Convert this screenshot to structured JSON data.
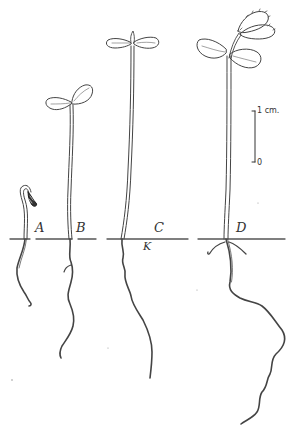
{
  "figure": {
    "ink_color": "#444444",
    "background": "#ffffff",
    "seedlings": [
      {
        "id": "A",
        "label": "A",
        "stage": "hooked hypocotyl emerging, seed coat attached"
      },
      {
        "id": "B",
        "label": "B",
        "stage": "two small cotyledons expanded"
      },
      {
        "id": "C",
        "label": "C",
        "stage": "tall hypocotyl with open cotyledons"
      },
      {
        "id": "D",
        "label": "D",
        "stage": "cotyledons with first true leaves, branched long root"
      }
    ],
    "annotations": {
      "k_marker": "K"
    },
    "scale_bar": {
      "top_label": "1 cm.",
      "bottom_label": "0"
    }
  }
}
